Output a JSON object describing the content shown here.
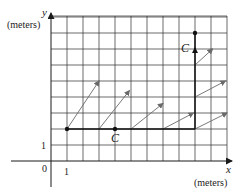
{
  "diagram": {
    "title": "",
    "x_axis": {
      "label": "x",
      "unit": "(meters)",
      "tick_label": "1"
    },
    "y_axis": {
      "label": "y",
      "unit": "(meters)",
      "tick_label": "1"
    },
    "origin_label": "0",
    "grid": {
      "x_min": 0,
      "x_max": 11,
      "y_min": 0,
      "y_max": 9,
      "step": 1
    },
    "path": {
      "name": "C",
      "points": [
        [
          1,
          2
        ],
        [
          9,
          2
        ],
        [
          9,
          8
        ]
      ],
      "labels": [
        {
          "text": "C",
          "at": [
            4,
            2
          ],
          "position": "below"
        },
        {
          "text": "C",
          "at": [
            9,
            7
          ],
          "position": "left"
        }
      ],
      "dots": [
        [
          1,
          2
        ],
        [
          4,
          2
        ],
        [
          9,
          8
        ]
      ]
    },
    "vector_field": [
      {
        "from": [
          1,
          2
        ],
        "to": [
          3,
          5
        ]
      },
      {
        "from": [
          3,
          2
        ],
        "to": [
          4.9,
          4.4
        ]
      },
      {
        "from": [
          5,
          2
        ],
        "to": [
          7,
          3.6
        ]
      },
      {
        "from": [
          7,
          2
        ],
        "to": [
          8.9,
          3
        ]
      },
      {
        "from": [
          9,
          2
        ],
        "to": [
          11,
          3
        ]
      },
      {
        "from": [
          9,
          4
        ],
        "to": [
          10.9,
          5
        ]
      },
      {
        "from": [
          9,
          6
        ],
        "to": [
          10.1,
          7
        ]
      }
    ],
    "colors": {
      "grid": "#2b2b2b",
      "path": "#111111",
      "vectors": "#6a6a6a"
    }
  }
}
